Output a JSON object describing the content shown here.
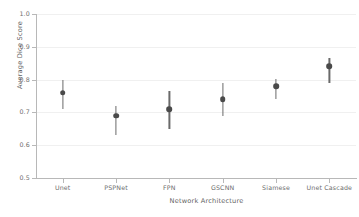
{
  "chart_data": {
    "type": "scatter",
    "title": "",
    "xlabel": "Network Architecture",
    "ylabel": "Average Dice Score",
    "categories": [
      "Unet",
      "PSPNet",
      "FPN",
      "GSCNN",
      "Siamese",
      "Unet Cascade"
    ],
    "values": [
      0.76,
      0.69,
      0.71,
      0.74,
      0.78,
      0.84
    ],
    "error_low": [
      0.71,
      0.63,
      0.65,
      0.69,
      0.742,
      0.791
    ],
    "error_high": [
      0.8,
      0.72,
      0.766,
      0.79,
      0.801,
      0.866
    ],
    "ylim": [
      0.5,
      1.0
    ],
    "yticks": [
      "0.5",
      "0.6",
      "0.7",
      "0.8",
      "0.9",
      "1.0"
    ],
    "ytick_values": [
      0.5,
      0.6,
      0.7,
      0.8,
      0.9,
      1.0
    ],
    "grid": true,
    "legend": "none",
    "series": [
      {
        "name": "Average Dice Score",
        "values": [
          0.76,
          0.69,
          0.71,
          0.74,
          0.78,
          0.84
        ]
      }
    ]
  },
  "style": {
    "marker_color": "#4a4a4a",
    "errorbar_color": "#6a6a6a",
    "gridline_color": "#f0f0f0",
    "spine_color": "#b8b8b8",
    "tick_label_color": "#6e6e6e",
    "axis_label_color": "#5f5f5f",
    "background": "#ffffff"
  }
}
